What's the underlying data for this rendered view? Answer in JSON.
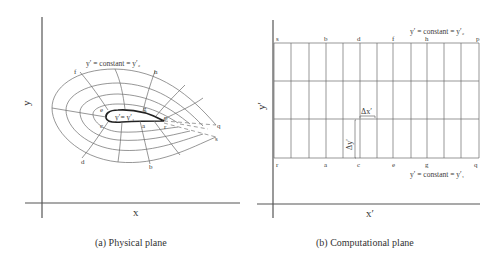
{
  "physical_plane": {
    "caption": "(a) Physical plane",
    "x_axis_label": "x",
    "y_axis_label": "y",
    "outer_boundary_label": "y′ = constant = y′₂",
    "inner_boundary_label": "y′= y′₁",
    "point_labels": {
      "f": "f",
      "h": "h",
      "e": "e",
      "g": "g",
      "c": "c",
      "a": "a",
      "p": "p",
      "r": "r",
      "q": "q",
      "s": "s",
      "d": "d",
      "b": "b"
    }
  },
  "computational_plane": {
    "caption": "(b) Computational plane",
    "x_axis_label": "x′",
    "y_axis_label": "y′",
    "top_boundary_label": "y′ = constant = y′₂",
    "bottom_boundary_label": "y′ = constant = y′₁",
    "top_points": [
      "s",
      "b",
      "d",
      "f",
      "h",
      "p"
    ],
    "bottom_points": [
      "r",
      "a",
      "c",
      "e",
      "g",
      "q"
    ],
    "delta_x_label": "Δx′",
    "delta_y_label": "Δy′",
    "grid_columns": 12,
    "grid_rows": 3
  }
}
